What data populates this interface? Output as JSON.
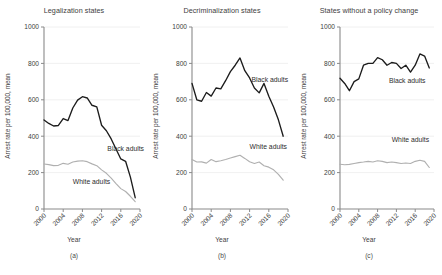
{
  "figure": {
    "width": 442,
    "height": 275,
    "background": "#ffffff",
    "black_series_color": "#1c1c1c",
    "white_series_color": "#b0b0b0",
    "axis_color": "#8a8a8a",
    "grid_color": "#ececec"
  },
  "common": {
    "ylabel": "Arrest rate per 100,000, mean",
    "xlabel": "Year",
    "ytick_labels": [
      "0",
      "200",
      "400",
      "600",
      "800",
      "1000"
    ],
    "ytick_values": [
      0,
      200,
      400,
      600,
      800,
      1000
    ],
    "xtick_labels": [
      "2000",
      "2004",
      "2008",
      "2012",
      "2016",
      "2020"
    ],
    "xtick_values": [
      2000,
      2004,
      2008,
      2012,
      2016,
      2020
    ],
    "black_label": "Black adults",
    "white_label": "White adults"
  },
  "panels": [
    {
      "letter": "(a)",
      "title": "Legalization states"
    },
    {
      "letter": "(b)",
      "title": "Decriminalization states"
    },
    {
      "letter": "(c)",
      "title": "States without a policy change"
    }
  ],
  "chart_data": [
    {
      "type": "line",
      "title": "Legalization states",
      "panel": "(a)",
      "xlabel": "Year",
      "ylabel": "Arrest rate per 100,000, mean",
      "xlim": [
        2000,
        2020
      ],
      "ylim": [
        0,
        1000
      ],
      "grid": true,
      "legend": "inline-annotation",
      "x": [
        2000,
        2001,
        2002,
        2003,
        2004,
        2005,
        2006,
        2007,
        2008,
        2009,
        2010,
        2011,
        2012,
        2013,
        2014,
        2015,
        2016,
        2017,
        2018,
        2019
      ],
      "series": [
        {
          "name": "Black adults",
          "color": "#1c1c1c",
          "values": [
            489,
            470,
            456,
            459,
            497,
            486,
            555,
            598,
            617,
            610,
            570,
            561,
            460,
            430,
            385,
            330,
            275,
            262,
            175,
            62
          ]
        },
        {
          "name": "White adults",
          "color": "#b0b0b0",
          "values": [
            247,
            244,
            238,
            240,
            251,
            246,
            258,
            263,
            265,
            260,
            248,
            238,
            215,
            196,
            170,
            140,
            112,
            96,
            70,
            40
          ]
        }
      ]
    },
    {
      "type": "line",
      "title": "Decriminalization states",
      "panel": "(b)",
      "xlabel": "Year",
      "ylabel": "Arrest rate per 100,000, mean",
      "xlim": [
        2000,
        2020
      ],
      "ylim": [
        0,
        1000
      ],
      "grid": true,
      "legend": "inline-annotation",
      "x": [
        2000,
        2001,
        2002,
        2003,
        2004,
        2005,
        2006,
        2007,
        2008,
        2009,
        2010,
        2011,
        2012,
        2013,
        2014,
        2015,
        2016,
        2017,
        2018,
        2019
      ],
      "series": [
        {
          "name": "Black adults",
          "color": "#1c1c1c",
          "values": [
            690,
            600,
            592,
            640,
            620,
            665,
            660,
            705,
            755,
            790,
            830,
            760,
            720,
            665,
            638,
            690,
            620,
            560,
            490,
            400
          ]
        },
        {
          "name": "White adults",
          "color": "#b0b0b0",
          "values": [
            272,
            258,
            259,
            252,
            272,
            260,
            265,
            272,
            280,
            288,
            295,
            278,
            260,
            250,
            258,
            238,
            230,
            215,
            190,
            158
          ]
        }
      ]
    },
    {
      "type": "line",
      "title": "States without a policy change",
      "panel": "(c)",
      "xlabel": "Year",
      "ylabel": "Arrest rate per 100,000, mean",
      "xlim": [
        2000,
        2020
      ],
      "ylim": [
        0,
        1000
      ],
      "grid": true,
      "legend": "inline-annotation",
      "x": [
        2000,
        2001,
        2002,
        2003,
        2004,
        2005,
        2006,
        2007,
        2008,
        2009,
        2010,
        2011,
        2012,
        2013,
        2014,
        2015,
        2016,
        2017,
        2018,
        2019
      ],
      "series": [
        {
          "name": "Black adults",
          "color": "#1c1c1c",
          "values": [
            718,
            690,
            650,
            700,
            715,
            790,
            800,
            800,
            832,
            820,
            790,
            805,
            800,
            772,
            790,
            752,
            790,
            852,
            840,
            775
          ]
        },
        {
          "name": "White adults",
          "color": "#b0b0b0",
          "values": [
            246,
            243,
            245,
            250,
            255,
            258,
            262,
            258,
            265,
            262,
            255,
            258,
            255,
            250,
            253,
            250,
            262,
            268,
            262,
            228
          ]
        }
      ]
    }
  ]
}
